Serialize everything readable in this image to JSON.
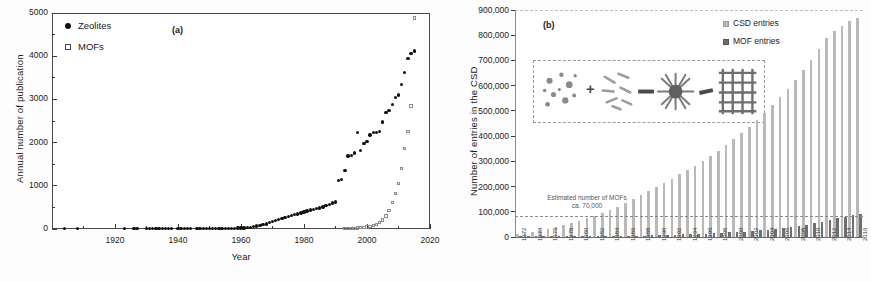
{
  "figure": {
    "background": "#ffffff",
    "panels": [
      "(a)",
      "(b)"
    ]
  },
  "chart_data": [
    {
      "type": "scatter",
      "panel_label": "(a)",
      "title": "",
      "xlabel": "Year",
      "ylabel": "Annual number of publication",
      "xlim": [
        1900,
        2020
      ],
      "ylim": [
        0,
        5000
      ],
      "xticks": [
        1920,
        1940,
        1960,
        1980,
        2000,
        2020
      ],
      "yticks": [
        0,
        1000,
        2000,
        3000,
        4000,
        5000
      ],
      "grid": false,
      "legend_position": "top-left",
      "series": [
        {
          "name": "Zeolites",
          "marker": "filled-circle",
          "color": "#111111",
          "x": [
            1904,
            1908,
            1923,
            1926,
            1927,
            1930,
            1931,
            1932,
            1933,
            1934,
            1935,
            1936,
            1937,
            1938,
            1940,
            1941,
            1942,
            1943,
            1944,
            1946,
            1947,
            1948,
            1949,
            1950,
            1951,
            1952,
            1953,
            1954,
            1955,
            1956,
            1957,
            1958,
            1959,
            1960,
            1961,
            1962,
            1963,
            1964,
            1965,
            1966,
            1967,
            1968,
            1969,
            1970,
            1971,
            1972,
            1973,
            1974,
            1975,
            1976,
            1977,
            1978,
            1979,
            1980,
            1981,
            1982,
            1983,
            1984,
            1985,
            1986,
            1987,
            1988,
            1989,
            1990,
            1991,
            1992,
            1993,
            1994,
            1995,
            1996,
            1997,
            1998,
            1999,
            2000,
            2001,
            2002,
            2003,
            2004,
            2005,
            2006,
            2007,
            2008,
            2009,
            2010,
            2011,
            2012,
            2013,
            2014,
            2015
          ],
          "y": [
            5,
            5,
            5,
            5,
            5,
            8,
            8,
            8,
            8,
            8,
            8,
            8,
            8,
            8,
            10,
            10,
            10,
            10,
            10,
            12,
            12,
            12,
            12,
            14,
            14,
            14,
            14,
            16,
            16,
            16,
            18,
            18,
            20,
            22,
            26,
            32,
            40,
            52,
            66,
            82,
            100,
            120,
            145,
            170,
            195,
            215,
            240,
            265,
            290,
            310,
            330,
            350,
            372,
            395,
            420,
            440,
            455,
            470,
            490,
            510,
            540,
            570,
            600,
            625,
            1120,
            1140,
            1350,
            1690,
            1700,
            1760,
            2230,
            1820,
            1980,
            2020,
            2180,
            2230,
            2230,
            2250,
            2480,
            2700,
            2740,
            2880,
            3050,
            3100,
            3350,
            3620,
            3950,
            4060,
            4120
          ]
        },
        {
          "name": "MOFs",
          "marker": "open-square",
          "color": "#8d8d8d",
          "x": [
            1993,
            1994,
            1995,
            1996,
            1997,
            1998,
            1999,
            2000,
            2001,
            2002,
            2003,
            2004,
            2005,
            2006,
            2007,
            2008,
            2009,
            2010,
            2011,
            2012,
            2013,
            2014,
            2015
          ],
          "y": [
            10,
            12,
            15,
            18,
            22,
            28,
            35,
            45,
            60,
            80,
            110,
            150,
            210,
            300,
            430,
            620,
            820,
            1060,
            1400,
            1860,
            2250,
            2850,
            4880
          ]
        }
      ]
    },
    {
      "type": "bar",
      "panel_label": "(b)",
      "title": "",
      "xlabel": "",
      "ylabel": "Number of entries in the CSD",
      "ylim": [
        0,
        900000
      ],
      "yticks": [
        0,
        100000,
        200000,
        300000,
        400000,
        500000,
        600000,
        700000,
        800000,
        900000
      ],
      "ytick_labels": [
        "0",
        "100,000",
        "200,000",
        "300,000",
        "400,000",
        "500,000",
        "600,000",
        "700,000",
        "800,000",
        "900,000"
      ],
      "grid": false,
      "legend_position": "top-right",
      "annotation": {
        "line1": "Estimated number of MOFs",
        "line2": "ca. 70,000",
        "value": 70000
      },
      "categories": [
        1972,
        1973,
        1974,
        1975,
        1976,
        1977,
        1978,
        1979,
        1980,
        1981,
        1982,
        1983,
        1984,
        1985,
        1986,
        1987,
        1988,
        1989,
        1990,
        1991,
        1992,
        1993,
        1994,
        1995,
        1996,
        1997,
        1998,
        1999,
        2000,
        2001,
        2002,
        2003,
        2004,
        2005,
        2006,
        2007,
        2008,
        2009,
        2010,
        2011,
        2012,
        2013,
        2014,
        2015,
        2016
      ],
      "tick_labels": [
        "1972",
        "1974",
        "1976",
        "1978",
        "1980",
        "1982",
        "1984",
        "1986",
        "1988",
        "1990",
        "1992",
        "1994",
        "1996",
        "1998",
        "2000",
        "2002",
        "2004",
        "2006",
        "2008",
        "2010",
        "2012",
        "2014",
        "2016"
      ],
      "series": [
        {
          "name": "CSD entries",
          "color": "#b9b9b9",
          "values": [
            12000,
            16000,
            21000,
            27000,
            33000,
            40000,
            47000,
            55000,
            64000,
            74000,
            84000,
            95000,
            107000,
            120000,
            134000,
            149000,
            165000,
            182000,
            200000,
            216000,
            232000,
            248000,
            265000,
            283000,
            302000,
            322000,
            343000,
            365000,
            388000,
            412000,
            437000,
            464000,
            492000,
            522000,
            554000,
            588000,
            624000,
            662000,
            702000,
            745000,
            790000,
            816000,
            838000,
            855000,
            870000
          ]
        },
        {
          "name": "MOF entries",
          "color": "#6e6e6e",
          "values": [
            200,
            300,
            400,
            500,
            700,
            900,
            1100,
            1400,
            1700,
            2000,
            2400,
            2800,
            3300,
            3800,
            4400,
            5000,
            5700,
            6500,
            7300,
            8200,
            9100,
            10100,
            11200,
            12400,
            13700,
            15100,
            16600,
            18200,
            19900,
            21800,
            23900,
            26300,
            29000,
            32000,
            35500,
            39500,
            44000,
            49000,
            54500,
            61000,
            68000,
            75000,
            81000,
            86000,
            90000
          ]
        }
      ]
    }
  ],
  "panel_a": {
    "tag": "(a)",
    "axis": {
      "ylabel": "Annual number of publication",
      "xlabel": "Year"
    },
    "legend": [
      {
        "label": "Zeolites",
        "marker": "filled-circle"
      },
      {
        "label": "MOFs",
        "marker": "open-square"
      }
    ]
  },
  "panel_b": {
    "tag": "(b)",
    "axis": {
      "ylabel": "Number of entries in the CSD"
    },
    "legend": [
      {
        "label": "CSD entries",
        "color": "#b9b9b9"
      },
      {
        "label": "MOF entries",
        "color": "#6e6e6e"
      }
    ],
    "annotation_line1": "Estimated number of MOFs",
    "annotation_line2": "ca. 70,000",
    "inset": {
      "name": "mof-assembly-schematic",
      "plus": "+",
      "arrow1": "—",
      "arrow2": "→"
    }
  }
}
